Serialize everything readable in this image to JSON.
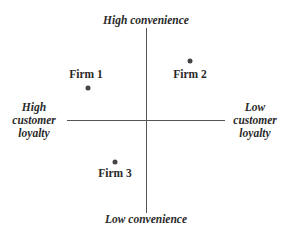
{
  "axes": {
    "top": "High convenience",
    "bottom": "Low convenience",
    "left": [
      "High",
      "customer",
      "loyalty"
    ],
    "right": [
      "Low",
      "customer",
      "loyalty"
    ]
  },
  "firms": [
    {
      "label": "Firm 1",
      "dot": [
        88,
        88
      ],
      "label_pos": [
        86,
        68
      ]
    },
    {
      "label": "Firm 2",
      "dot": [
        190,
        61
      ],
      "label_pos": [
        190,
        68
      ]
    },
    {
      "label": "Firm 3",
      "dot": [
        115,
        162
      ],
      "label_pos": [
        115,
        167
      ]
    }
  ]
}
